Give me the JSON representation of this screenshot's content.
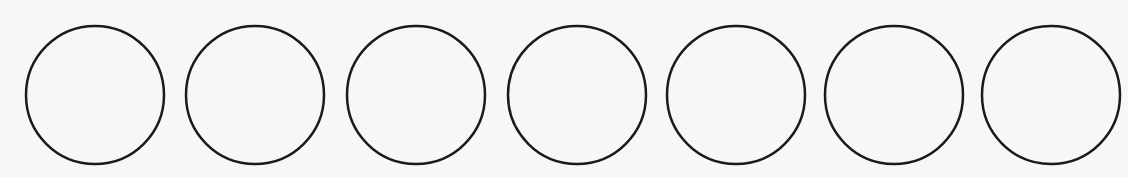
{
  "canvas": {
    "width": 1128,
    "height": 177,
    "background": "#f7f7f6"
  },
  "style": {
    "stroke_color": "#1a1a1a",
    "stroke_width": 2.5,
    "fill": "none"
  },
  "circles": [
    {
      "cx": 95,
      "cy": 95,
      "r": 69
    },
    {
      "cx": 255,
      "cy": 95,
      "r": 69
    },
    {
      "cx": 416,
      "cy": 95,
      "r": 69
    },
    {
      "cx": 577,
      "cy": 95,
      "r": 69
    },
    {
      "cx": 736,
      "cy": 95,
      "r": 69
    },
    {
      "cx": 894,
      "cy": 95,
      "r": 69
    },
    {
      "cx": 1051,
      "cy": 95,
      "r": 69
    }
  ],
  "count": 7
}
